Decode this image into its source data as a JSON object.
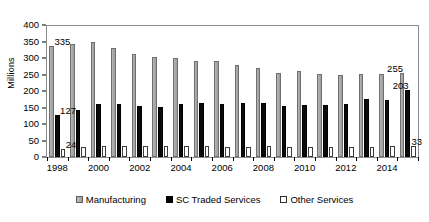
{
  "chart_data": {
    "type": "bar",
    "title": "",
    "xlabel": "",
    "ylabel": "Millions",
    "ylim": [
      0,
      400
    ],
    "ytick_step": 50,
    "yticks": [
      0,
      50,
      100,
      150,
      200,
      250,
      300,
      350,
      400
    ],
    "grid": false,
    "legend_position": "bottom",
    "categories": [
      "1998",
      "1999",
      "2000",
      "2001",
      "2002",
      "2003",
      "2004",
      "2005",
      "2006",
      "2007",
      "2008",
      "2009",
      "2010",
      "2011",
      "2012",
      "2013",
      "2014",
      "2015"
    ],
    "xtick_labels_shown": [
      "1998",
      "2000",
      "2002",
      "2004",
      "2006",
      "2008",
      "2010",
      "2012",
      "2014"
    ],
    "series": [
      {
        "name": "Manufacturing",
        "color": "#a8a8a8",
        "values": [
          335,
          341,
          348,
          331,
          312,
          302,
          299,
          292,
          290,
          280,
          271,
          255,
          261,
          252,
          249,
          251,
          253,
          255
        ]
      },
      {
        "name": "SC Traded Services",
        "color": "#000000",
        "values": [
          127,
          143,
          161,
          160,
          155,
          153,
          161,
          165,
          162,
          164,
          163,
          155,
          158,
          157,
          162,
          175,
          172,
          203
        ]
      },
      {
        "name": "Other Services",
        "color": "#ffffff",
        "values": [
          24,
          29,
          32,
          33,
          34,
          33,
          33,
          32,
          31,
          31,
          32,
          30,
          30,
          30,
          30,
          31,
          32,
          33
        ]
      }
    ],
    "annotations": [
      {
        "text": "335",
        "series": "Manufacturing",
        "category": "1998"
      },
      {
        "text": "127",
        "series": "SC Traded Services",
        "category": "1998"
      },
      {
        "text": "24",
        "series": "Other Services",
        "category": "1998"
      },
      {
        "text": "255",
        "series": "Manufacturing",
        "category": "2015"
      },
      {
        "text": "203",
        "series": "SC Traded Services",
        "category": "2015"
      },
      {
        "text": "33",
        "series": "Other Services",
        "category": "2015"
      }
    ]
  },
  "legend": {
    "items": [
      {
        "label": "Manufacturing",
        "swatch": "manufacturing-swatch"
      },
      {
        "label": "SC Traded Services",
        "swatch": "sc-traded-services-swatch"
      },
      {
        "label": "Other Services",
        "swatch": "other-services-swatch"
      }
    ]
  }
}
